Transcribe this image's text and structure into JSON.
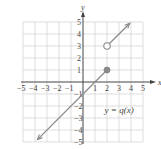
{
  "chart_data": {
    "type": "line",
    "title": "",
    "xlabel": "x",
    "ylabel": "y",
    "xlim": [
      -5,
      5
    ],
    "ylim": [
      -5,
      5
    ],
    "grid": true,
    "x_ticks": [
      "-5",
      "-4",
      "-3",
      "-2",
      "-1",
      "1",
      "2",
      "3",
      "4",
      "5"
    ],
    "y_ticks": [
      "5",
      "4",
      "3",
      "2",
      "1",
      "-1",
      "-2",
      "-3",
      "-4",
      "-5"
    ],
    "function_label": "y = q(x)",
    "series": [
      {
        "name": "lower piece",
        "rule": "y = x - 1 for x <= 2",
        "points": [
          [
            -3.8,
            -4.8
          ],
          [
            2,
            1
          ]
        ],
        "left_end": "arrow",
        "right_end": "closed-dot"
      },
      {
        "name": "upper piece",
        "rule": "y = x + 1 for x > 2",
        "points": [
          [
            2,
            3
          ],
          [
            3.9,
            4.9
          ]
        ],
        "left_end": "open-circle",
        "right_end": "arrow"
      }
    ],
    "markers": [
      {
        "type": "closed",
        "x": 2,
        "y": 1
      },
      {
        "type": "open",
        "x": 2,
        "y": 3
      }
    ]
  },
  "colors": {
    "grid": "#d0d0d0",
    "axis": "#444444",
    "line": "#8a8a8a",
    "text": "#444444"
  }
}
